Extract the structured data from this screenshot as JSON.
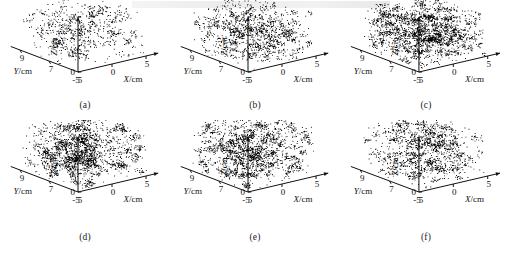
{
  "figure": {
    "type": "multi-panel-3d-scatter",
    "panel_count": 6,
    "layout": "2 rows x 3 columns",
    "background": "#ffffff",
    "point_color": "#000000"
  },
  "axes": {
    "x": {
      "label": "X/cm",
      "symbol": "X",
      "unit": "cm",
      "ticks": [
        "-5",
        "0",
        "5"
      ],
      "range": [
        -5,
        5
      ]
    },
    "y": {
      "label": "Y/cm",
      "symbol": "Y",
      "unit": "cm",
      "ticks": [
        "9",
        "7",
        "5"
      ],
      "range": [
        5,
        9
      ]
    },
    "z": {
      "label": "Z/cm",
      "symbol": "Z",
      "unit": "cm",
      "ticks": [
        "3",
        "2",
        "1",
        "0"
      ],
      "range": [
        0,
        3
      ]
    }
  },
  "chart_data": [
    {
      "type": "scatter",
      "id": "a",
      "caption": "(a)",
      "title": "",
      "xlabel": "X/cm",
      "ylabel": "Y/cm",
      "zlabel": "Z/cm",
      "xlim": [
        -5,
        5
      ],
      "ylim": [
        5,
        9
      ],
      "zlim": [
        0,
        3
      ],
      "xticks": [
        "-5",
        "0",
        "5"
      ],
      "yticks": [
        "9",
        "7",
        "5"
      ],
      "zticks": [
        "3",
        "2",
        "1",
        "0"
      ],
      "grid": false,
      "legend": false,
      "point_density": "sparse",
      "relative_density": 0.35,
      "n_points": 2600,
      "point_size": 0.9,
      "cloud_extent": {
        "x": [
          -5,
          5
        ],
        "y": [
          5,
          9
        ],
        "z": [
          0.05,
          2.45
        ]
      }
    },
    {
      "type": "scatter",
      "id": "b",
      "caption": "(b)",
      "title": "",
      "xlabel": "X/cm",
      "ylabel": "Y/cm",
      "zlabel": "Z/cm",
      "xlim": [
        -5,
        5
      ],
      "ylim": [
        5,
        9
      ],
      "zlim": [
        0,
        3
      ],
      "xticks": [
        "-5",
        "0",
        "5"
      ],
      "yticks": [
        "9",
        "7",
        "5"
      ],
      "zticks": [
        "3",
        "2",
        "1",
        "0"
      ],
      "grid": false,
      "legend": false,
      "point_density": "medium",
      "relative_density": 0.58,
      "n_points": 4300,
      "point_size": 0.9,
      "cloud_extent": {
        "x": [
          -5,
          5
        ],
        "y": [
          5,
          9
        ],
        "z": [
          0.05,
          2.3
        ]
      }
    },
    {
      "type": "scatter",
      "id": "c",
      "caption": "(c)",
      "title": "",
      "xlabel": "X/cm",
      "ylabel": "Y/cm",
      "zlabel": "Z/cm",
      "xlim": [
        -5,
        5
      ],
      "ylim": [
        5,
        9
      ],
      "zlim": [
        0,
        3
      ],
      "xticks": [
        "-5",
        "0",
        "5"
      ],
      "yticks": [
        "9",
        "7",
        "5"
      ],
      "zticks": [
        "3",
        "2",
        "1",
        "0"
      ],
      "grid": false,
      "legend": false,
      "point_density": "very-dense",
      "relative_density": 1.0,
      "n_points": 7400,
      "point_size": 0.9,
      "cloud_extent": {
        "x": [
          -5,
          5
        ],
        "y": [
          5,
          9
        ],
        "z": [
          0.05,
          2.35
        ]
      }
    },
    {
      "type": "scatter",
      "id": "d",
      "caption": "(d)",
      "title": "",
      "xlabel": "X/cm",
      "ylabel": "Y/cm",
      "zlabel": "Z/cm",
      "xlim": [
        -5,
        5
      ],
      "ylim": [
        5,
        9
      ],
      "zlim": [
        0,
        3
      ],
      "xticks": [
        "-5",
        "0",
        "5"
      ],
      "yticks": [
        "9",
        "7",
        "5"
      ],
      "zticks": [
        "3",
        "2",
        "1",
        "0"
      ],
      "grid": false,
      "legend": false,
      "point_density": "dense",
      "relative_density": 0.88,
      "n_points": 6500,
      "point_size": 0.9,
      "cloud_extent": {
        "x": [
          -5,
          5
        ],
        "y": [
          5,
          9
        ],
        "z": [
          0.05,
          2.5
        ]
      }
    },
    {
      "type": "scatter",
      "id": "e",
      "caption": "(e)",
      "title": "",
      "xlabel": "X/cm",
      "ylabel": "Y/cm",
      "zlabel": "Z/cm",
      "xlim": [
        -5,
        5
      ],
      "ylim": [
        5,
        9
      ],
      "zlim": [
        0,
        3
      ],
      "xticks": [
        "-5",
        "0",
        "5"
      ],
      "yticks": [
        "9",
        "7",
        "5"
      ],
      "zticks": [
        "3",
        "2",
        "1",
        "0"
      ],
      "grid": false,
      "legend": false,
      "point_density": "dense",
      "relative_density": 0.82,
      "n_points": 6100,
      "point_size": 0.9,
      "cloud_extent": {
        "x": [
          -5,
          5
        ],
        "y": [
          5,
          9
        ],
        "z": [
          0.05,
          2.6
        ]
      }
    },
    {
      "type": "scatter",
      "id": "f",
      "caption": "(f)",
      "title": "",
      "xlabel": "X/cm",
      "ylabel": "Y/cm",
      "zlabel": "Z/cm",
      "xlim": [
        -5,
        5
      ],
      "ylim": [
        5,
        9
      ],
      "zlim": [
        0,
        3
      ],
      "xticks": [
        "-5",
        "0",
        "5"
      ],
      "yticks": [
        "9",
        "7",
        "5"
      ],
      "zticks": [
        "3",
        "2",
        "1",
        "0"
      ],
      "grid": false,
      "legend": false,
      "point_density": "medium",
      "relative_density": 0.62,
      "n_points": 4600,
      "point_size": 0.9,
      "cloud_extent": {
        "x": [
          -5,
          5
        ],
        "y": [
          5,
          9
        ],
        "z": [
          0.05,
          2.5
        ]
      }
    }
  ]
}
